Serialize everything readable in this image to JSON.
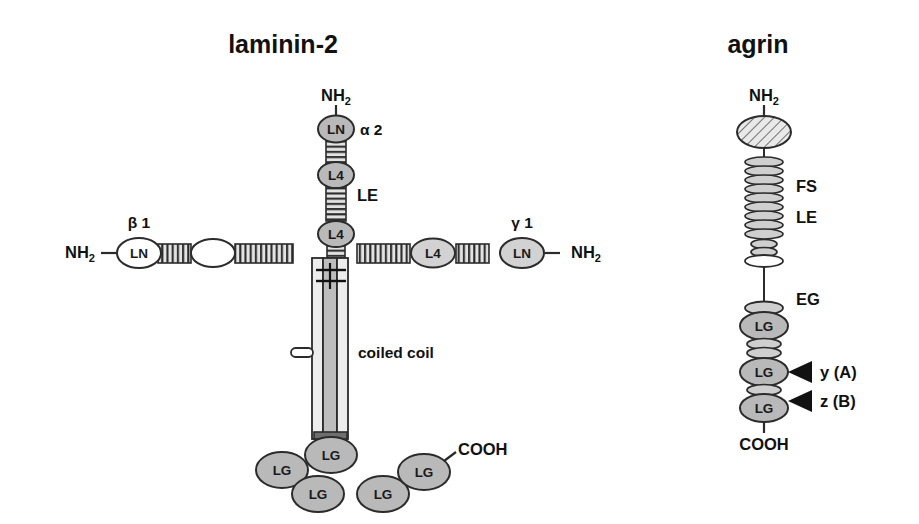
{
  "figure": {
    "type": "molecular-domain-diagram",
    "background": "#ffffff",
    "panels": [
      "laminin-2",
      "agrin"
    ]
  },
  "colors": {
    "outline": "#2b2b2b",
    "shaded_fill": "#b9b9b9",
    "light_fill": "#d2d2d2",
    "white_fill": "#ffffff",
    "coil_fill": "#bdbdbd",
    "coil_side_fill": "#ededed",
    "text": "#111111"
  },
  "laminin": {
    "title": "laminin-2",
    "alpha_arm": {
      "chain_label": "α 2",
      "terminus": "NH",
      "terminus_sub": "2",
      "rod_label": "LE",
      "domains": [
        {
          "label": "LN",
          "fill": "shaded"
        },
        {
          "label": "L4",
          "fill": "shaded"
        },
        {
          "label": "L4",
          "fill": "shaded"
        }
      ]
    },
    "beta_arm": {
      "chain_label": "β 1",
      "terminus": "NH",
      "terminus_sub": "2",
      "domains": [
        {
          "label": "LN",
          "fill": "white"
        },
        {
          "label": "",
          "fill": "white"
        }
      ]
    },
    "gamma_arm": {
      "chain_label": "γ 1",
      "terminus": "NH",
      "terminus_sub": "2",
      "domains": [
        {
          "label": "L4",
          "fill": "shaded"
        },
        {
          "label": "LN",
          "fill": "shaded"
        }
      ]
    },
    "coiled_coil": {
      "label": "coiled coil",
      "strands": 3,
      "disulfide_links": 2
    },
    "lg_domains": {
      "label": "LG",
      "count": 5,
      "terminus": "COOH"
    }
  },
  "agrin": {
    "title": "agrin",
    "terminus_n": "NH",
    "terminus_n_sub": "2",
    "terminus_c": "COOH",
    "nta_domain": {
      "label": "",
      "fill": "hatched"
    },
    "segments": [
      {
        "label": "FS",
        "discs": 9
      },
      {
        "label": "LE",
        "discs": 3
      },
      {
        "label": "EG",
        "discs": 1
      }
    ],
    "lg_label": "LG",
    "lg_count": 3,
    "splice_sites": [
      {
        "label": "y (A)"
      },
      {
        "label": "z (B)"
      }
    ]
  }
}
